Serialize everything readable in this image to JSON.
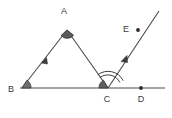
{
  "figure": {
    "background_color": "#ffffff",
    "stroke_color": "#4a4a4a",
    "label_color": "#3a3a3a",
    "arc_color": "#3f3f3f",
    "point_color": "#2b2b2b"
  },
  "points": [
    {
      "id": "A",
      "label": "A",
      "x": 67,
      "y": 30,
      "label_x": 64,
      "label_y": 14,
      "marked": false
    },
    {
      "id": "B",
      "label": "B",
      "x": 22,
      "y": 88,
      "label_x": 10,
      "label_y": 92,
      "marked": false
    },
    {
      "id": "C",
      "label": "C",
      "x": 108,
      "y": 88,
      "label_x": 106,
      "label_y": 101,
      "marked": false
    },
    {
      "id": "D",
      "label": "D",
      "x": 141,
      "y": 88,
      "label_x": 138,
      "label_y": 101,
      "marked": true
    },
    {
      "id": "E",
      "label": "E",
      "x": 138,
      "y": 30,
      "label_x": 125,
      "label_y": 31,
      "marked": true
    }
  ],
  "segments": [
    {
      "id": "BA",
      "from": "B",
      "to": "A",
      "tick": "single-arrow",
      "x1": 22,
      "y1": 88,
      "x2": 67,
      "y2": 30
    },
    {
      "id": "AC",
      "from": "A",
      "to": "C",
      "tick": "none",
      "x1": 67,
      "y1": 30,
      "x2": 108,
      "y2": 88
    },
    {
      "id": "BD-line",
      "from": "B",
      "to": "D",
      "tick": "none",
      "x1": 20,
      "y1": 88,
      "x2": 165,
      "y2": 88
    },
    {
      "id": "CE-ray",
      "from": "C",
      "to": "E",
      "tick": "single-arrow",
      "x1": 108,
      "y1": 88,
      "x2": 159,
      "y2": 11
    }
  ],
  "angle_marks": [
    {
      "id": "angle-B",
      "at": "B",
      "style": "arc-filled",
      "radius": 9
    },
    {
      "id": "angle-A",
      "at": "A",
      "style": "arc-filled",
      "radius": 8
    },
    {
      "id": "angle-BCA",
      "at": "C",
      "style": "arc-filled",
      "radius": 9
    },
    {
      "id": "angle-ACE",
      "at": "C",
      "style": "arc-double",
      "radius": 13
    }
  ],
  "labels": {
    "A": "A",
    "B": "B",
    "C": "C",
    "D": "D",
    "E": "E"
  }
}
